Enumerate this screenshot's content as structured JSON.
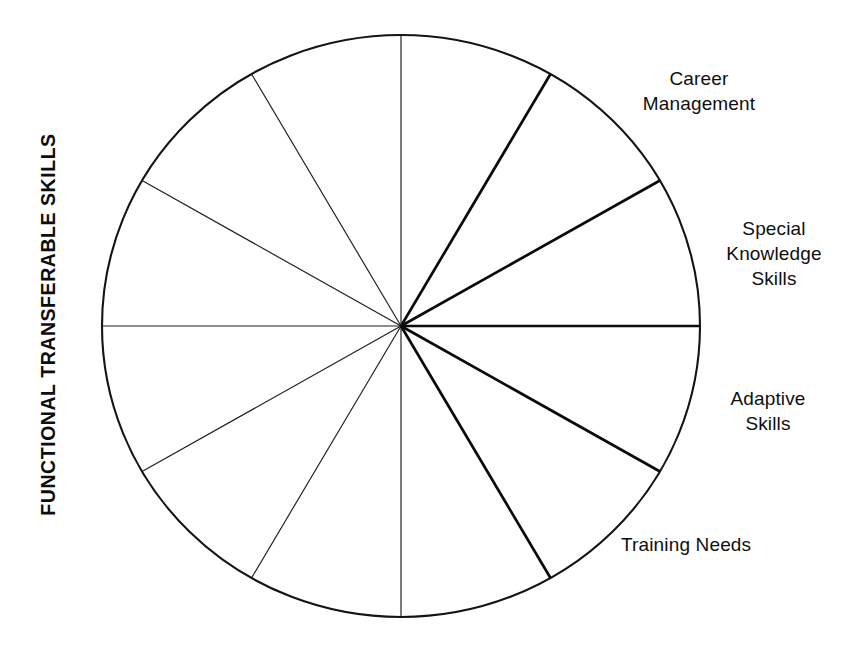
{
  "page": {
    "background_color": "#ffffff",
    "ink_color": "#111111",
    "width": 851,
    "height": 649
  },
  "title": {
    "text": "FUNCTIONAL TRANSFERABLE SKILLS",
    "orientation": "vertical-rotated-90-ccw",
    "weight": "bold"
  },
  "chart_data": {
    "type": "pie",
    "title": "FUNCTIONAL TRANSFERABLE SKILLS",
    "subtitle": "",
    "xlabel": "",
    "ylabel": "",
    "legend_position": "right-outside",
    "grid": false,
    "geometry": {
      "center_x": 401,
      "center_y": 326,
      "radius_x": 299,
      "radius_y": 291,
      "sector_count": 12,
      "sector_degrees": 30,
      "first_boundary_angle_deg": 0,
      "boundary_angles_deg": [
        0,
        30,
        60,
        90,
        120,
        150,
        180,
        210,
        240,
        270,
        300,
        330
      ]
    },
    "categories": [
      "Career Management",
      "Special Knowledge Skills",
      "Adaptive Skills",
      "Training Needs",
      "",
      "",
      "",
      "",
      "",
      "",
      "",
      ""
    ],
    "values": [
      30,
      30,
      30,
      30,
      30,
      30,
      30,
      30,
      30,
      30,
      30,
      30
    ],
    "ylim": [
      0,
      360
    ]
  },
  "labels": [
    {
      "id": "career-management",
      "text": "Career\nManagement",
      "align": "center",
      "left": 614,
      "top": 66,
      "width": 170,
      "sector_mid_angle_deg": 75
    },
    {
      "id": "special-knowledge-skills",
      "text": "Special\nKnowledge\nSkills",
      "align": "center",
      "left": 709,
      "top": 216,
      "width": 130,
      "sector_mid_angle_deg": 45
    },
    {
      "id": "adaptive-skills",
      "text": "Adaptive\nSkills",
      "align": "center",
      "left": 709,
      "top": 386,
      "width": 118,
      "sector_mid_angle_deg": -15
    },
    {
      "id": "training-needs",
      "text": "Training Needs",
      "align": "left",
      "left": 621,
      "top": 532,
      "width": 210,
      "sector_mid_angle_deg": -45
    }
  ],
  "spokes": [
    {
      "angle_deg": 0,
      "weight": "bold"
    },
    {
      "angle_deg": 30,
      "weight": "bold"
    },
    {
      "angle_deg": 60,
      "weight": "bold"
    },
    {
      "angle_deg": 90,
      "weight": "thin"
    },
    {
      "angle_deg": 120,
      "weight": "thin"
    },
    {
      "angle_deg": 150,
      "weight": "thin"
    },
    {
      "angle_deg": 180,
      "weight": "thin"
    },
    {
      "angle_deg": 210,
      "weight": "thin"
    },
    {
      "angle_deg": 240,
      "weight": "thin"
    },
    {
      "angle_deg": 270,
      "weight": "thin"
    },
    {
      "angle_deg": 300,
      "weight": "bold"
    },
    {
      "angle_deg": 330,
      "weight": "bold"
    }
  ]
}
